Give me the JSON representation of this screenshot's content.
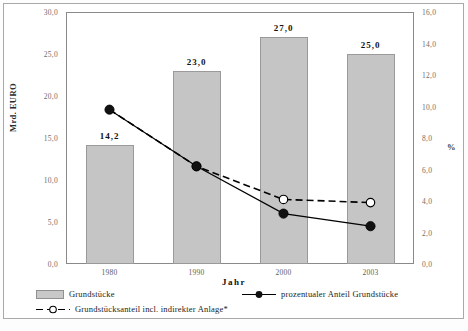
{
  "chart_data": {
    "type": "bar",
    "title": "",
    "xlabel": "Jahr",
    "ylabel": "Mrd. EURO",
    "y2label": "%",
    "categories": [
      "1980",
      "1990",
      "2000",
      "2003"
    ],
    "ylim": [
      0.0,
      30.0
    ],
    "y2lim": [
      0.0,
      16.0
    ],
    "yticks": [
      "0,0",
      "5,0",
      "10,0",
      "15,0",
      "20,0",
      "25,0",
      "30,0"
    ],
    "ytick_values": [
      0.0,
      5.0,
      10.0,
      15.0,
      20.0,
      25.0,
      30.0
    ],
    "y2ticks": [
      "0,0",
      "2,0",
      "4,0",
      "6,0",
      "8,0",
      "10,0",
      "12,0",
      "14,0",
      "16,0"
    ],
    "y2tick_values": [
      0.0,
      2.0,
      4.0,
      6.0,
      8.0,
      10.0,
      12.0,
      14.0,
      16.0
    ],
    "grid": false,
    "legend_position": "bottom",
    "series": [
      {
        "name": "Grundstücke",
        "type": "bar",
        "axis": "left",
        "values": [
          14.2,
          23.0,
          27.0,
          25.0
        ],
        "labels": [
          "14,2",
          "23,0",
          "27,0",
          "25,0"
        ],
        "color": "#c5c5c5"
      },
      {
        "name": "prozentualer Anteil Grundstücke",
        "type": "line",
        "axis": "right",
        "marker": "filled-circle",
        "line_style": "solid",
        "values": [
          9.8,
          6.2,
          3.2,
          2.4
        ],
        "color": "#000000"
      },
      {
        "name": "Grundstücksanteil incl. indirekter Anlage*",
        "type": "line",
        "axis": "right",
        "marker": "open-circle",
        "line_style": "dashed",
        "values": [
          9.8,
          6.2,
          4.1,
          3.9
        ],
        "color": "#000000"
      }
    ]
  },
  "axes": {
    "left_title": "Mrd. EURO",
    "right_title": "%",
    "bottom_title": "Jahr"
  },
  "legend": {
    "items": [
      {
        "label": "Grundstücke",
        "marker": "bar-swatch"
      },
      {
        "label": "prozentualer Anteil Grundstücke",
        "marker": "solid-line-filled-circle"
      },
      {
        "label": "Grundstücksanteil incl. indirekter Anlage*",
        "marker": "dashed-line-open-circle"
      }
    ]
  }
}
